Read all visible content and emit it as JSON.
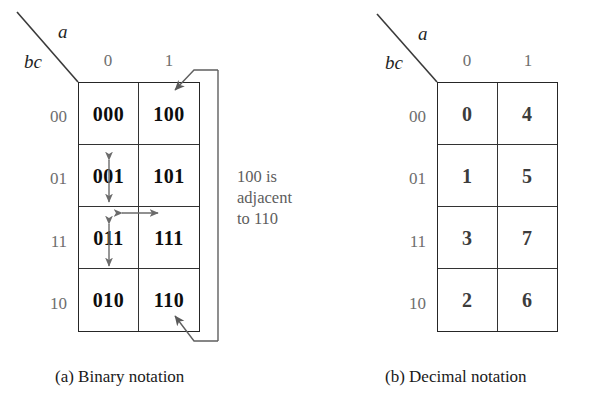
{
  "figure": {
    "background": "#ffffff",
    "line_color": "#333333",
    "label_color": "#6e6e6e",
    "annotation_color": "#5d5d5d"
  },
  "panels": [
    {
      "id": "binary",
      "caption": "(a)  Binary notation",
      "column_variable": "a",
      "row_variable": "bc",
      "column_headers": [
        "0",
        "1"
      ],
      "row_headers": [
        "00",
        "01",
        "11",
        "10"
      ],
      "cells": [
        [
          "000",
          "100"
        ],
        [
          "001",
          "101"
        ],
        [
          "011",
          "111"
        ],
        [
          "010",
          "110"
        ]
      ]
    },
    {
      "id": "decimal",
      "caption": "(b)  Decimal notation",
      "column_variable": "a",
      "row_variable": "bc",
      "column_headers": [
        "0",
        "1"
      ],
      "row_headers": [
        "00",
        "01",
        "11",
        "10"
      ],
      "cells": [
        [
          "0",
          "4"
        ],
        [
          "1",
          "5"
        ],
        [
          "3",
          "7"
        ],
        [
          "2",
          "6"
        ]
      ]
    }
  ],
  "annotation": {
    "lines": [
      "100 is",
      "adjacent",
      "to 110"
    ],
    "from_cell": "100",
    "to_cell": "110"
  },
  "adjacency_arrows": [
    {
      "name": "001-011",
      "direction": "vertical"
    },
    {
      "name": "011-010",
      "direction": "vertical"
    },
    {
      "name": "011-111",
      "direction": "horizontal"
    }
  ]
}
